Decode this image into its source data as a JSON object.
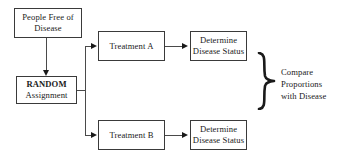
{
  "diagram": {
    "type": "flowchart",
    "colors": {
      "background": "#ffffff",
      "box_border": "#3a3a3a",
      "connector": "#4a4a4a",
      "text": "#1a1a1a"
    },
    "nodes": [
      {
        "id": "source",
        "name": "people-free-of-disease",
        "lines": [
          "People Free of",
          "Disease"
        ],
        "bold": false
      },
      {
        "id": "random",
        "name": "random-assignment",
        "lines": [
          "RANDOM",
          "Assignment"
        ],
        "bold": true
      },
      {
        "id": "treatment_a",
        "name": "treatment-a",
        "lines": [
          "Treatment A"
        ],
        "bold": false
      },
      {
        "id": "treatment_b",
        "name": "treatment-b",
        "lines": [
          "Treatment B"
        ],
        "bold": false
      },
      {
        "id": "status_a",
        "name": "determine-disease-status-a",
        "lines": [
          "Determine",
          "Disease Status"
        ],
        "bold": false
      },
      {
        "id": "status_b",
        "name": "determine-disease-status-b",
        "lines": [
          "Determine",
          "Disease Status"
        ],
        "bold": false
      }
    ],
    "annotation": {
      "brace": "right-curly-brace",
      "lines": [
        "Compare",
        "Proportions",
        "with Disease"
      ]
    },
    "edges": [
      {
        "from": "source",
        "to": "random",
        "arrow": "down"
      },
      {
        "from": "random",
        "to": "treatment_a",
        "arrow": "right"
      },
      {
        "from": "random",
        "to": "treatment_b",
        "arrow": "right"
      },
      {
        "from": "treatment_a",
        "to": "status_a",
        "arrow": "right"
      },
      {
        "from": "treatment_b",
        "to": "status_b",
        "arrow": "right"
      }
    ]
  }
}
